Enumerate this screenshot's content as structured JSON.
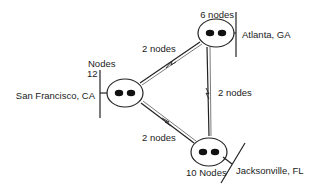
{
  "diagram": {
    "colors": {
      "stroke": "#222222",
      "text": "#222222",
      "background": "#ffffff"
    },
    "routers": [
      {
        "id": "san-francisco",
        "location": "San Francisco, CA",
        "node_count_label_top": "Nodes",
        "node_count_label_num": "12",
        "icon": "router-icon"
      },
      {
        "id": "atlanta",
        "location": "Atlanta, GA",
        "node_count_label": "6 nodes",
        "icon": "router-icon"
      },
      {
        "id": "jacksonville",
        "location": "Jacksonville, FL",
        "node_count_label": "10 Nodes",
        "icon": "router-icon"
      }
    ],
    "links": [
      {
        "from": "san-francisco",
        "to": "atlanta",
        "label": "2 nodes",
        "icon": "wan-link-icon"
      },
      {
        "from": "atlanta",
        "to": "jacksonville",
        "label": "2 nodes",
        "icon": "wan-link-icon"
      },
      {
        "from": "san-francisco",
        "to": "jacksonville",
        "label": "2 nodes",
        "icon": "wan-link-icon"
      }
    ]
  }
}
